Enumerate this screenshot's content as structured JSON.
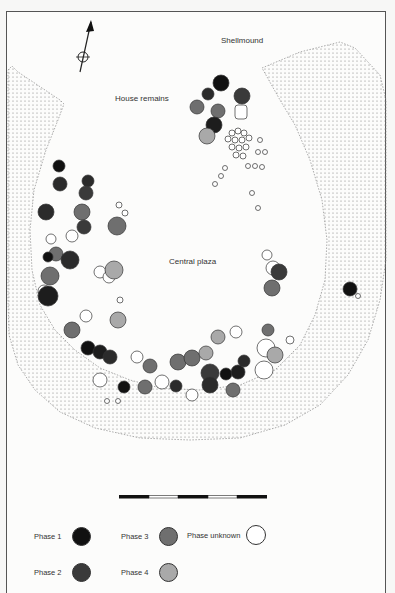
{
  "map": {
    "labels": {
      "shellmound": "Shellmound",
      "house_remains": "House remains",
      "central_plaza": "Central plaza"
    },
    "north_arrow": "north-arrow-icon",
    "scale_bar": {
      "segments": [
        "black",
        "white",
        "black",
        "white",
        "black"
      ]
    }
  },
  "legend": {
    "items": [
      {
        "label": "Phase 1",
        "color": "#111111"
      },
      {
        "label": "Phase 2",
        "color": "#3a3a3a"
      },
      {
        "label": "Phase 3",
        "color": "#6f6f6f"
      },
      {
        "label": "Phase 4",
        "color": "#a9a9a9"
      },
      {
        "label": "Phase unknown",
        "color": "#ffffff"
      }
    ]
  }
}
